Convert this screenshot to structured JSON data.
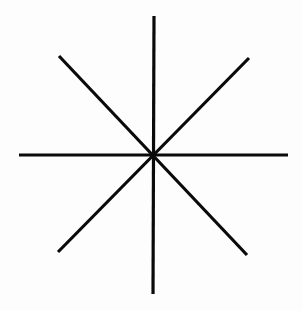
{
  "figure": {
    "type": "eight-pointed-asterisk",
    "background_color": "#fdfdfd",
    "stroke_color": "#0a0a0a",
    "stroke_width": 3.2,
    "center": [
      154,
      155
    ],
    "lines": [
      {
        "name": "vertical-line",
        "x1": 154,
        "y1": 16,
        "x2": 153,
        "y2": 294
      },
      {
        "name": "horizontal-line",
        "x1": 19,
        "y1": 155,
        "x2": 288,
        "y2": 155
      },
      {
        "name": "diagonal-line-tl-br",
        "x1": 59,
        "y1": 56,
        "x2": 247,
        "y2": 255
      },
      {
        "name": "diagonal-line-tr-bl",
        "x1": 249,
        "y1": 58,
        "x2": 58,
        "y2": 252
      }
    ]
  }
}
